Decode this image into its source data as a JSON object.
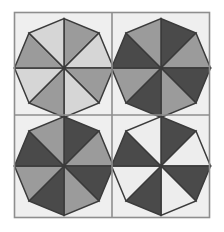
{
  "figure": {
    "type": "geometric-pattern",
    "canvas": {
      "width": 224,
      "height": 232,
      "background": "#ffffff"
    },
    "frame": {
      "x": 14.5,
      "y": 12.5,
      "width": 195,
      "height": 205,
      "stroke": "#8e8e8e",
      "stroke_width": 1.6,
      "fill": "#efefef"
    },
    "divider": {
      "stroke": "#8e8e8e",
      "stroke_width": 1.6,
      "vertical_x": 112,
      "horizontal_y": 115
    },
    "edge_stroke": "#3b3b3b",
    "edge_stroke_width": 1.5,
    "palette": {
      "very_light": "#ededed",
      "light": "#d6d6d6",
      "medium": "#9b9b9b",
      "dark": "#4a4a4a",
      "background": "#efefef",
      "frame_line": "#8e8e8e",
      "triangle_line": "#3b3b3b"
    },
    "panels": [
      {
        "name": "top-left",
        "center": [
          64,
          68
        ],
        "bounds": [
          14.5,
          12.5,
          112,
          115
        ],
        "octagon_radius_axis": 49.5,
        "octagon_radius_diag": 49.5,
        "colors": [
          "#9b9b9b",
          "#d6d6d6",
          "#9b9b9b",
          "#d6d6d6",
          "#9b9b9b",
          "#d6d6d6",
          "#9b9b9b",
          "#d6d6d6"
        ]
      },
      {
        "name": "top-right",
        "center": [
          161,
          68
        ],
        "bounds": [
          112,
          12.5,
          209.5,
          115
        ],
        "octagon_radius_axis": 49.5,
        "octagon_radius_diag": 49.5,
        "colors": [
          "#4a4a4a",
          "#9b9b9b",
          "#4a4a4a",
          "#9b9b9b",
          "#4a4a4a",
          "#9b9b9b",
          "#4a4a4a",
          "#9b9b9b"
        ]
      },
      {
        "name": "bottom-left",
        "center": [
          64,
          166
        ],
        "bounds": [
          14.5,
          115,
          112,
          217.5
        ],
        "octagon_radius_axis": 49.5,
        "octagon_radius_diag": 49.5,
        "colors": [
          "#4a4a4a",
          "#9b9b9b",
          "#4a4a4a",
          "#9b9b9b",
          "#4a4a4a",
          "#9b9b9b",
          "#4a4a4a",
          "#9b9b9b"
        ]
      },
      {
        "name": "bottom-right",
        "center": [
          161,
          166
        ],
        "bounds": [
          112,
          115,
          209.5,
          217.5
        ],
        "octagon_radius_axis": 49.5,
        "octagon_radius_diag": 49.5,
        "colors": [
          "#4a4a4a",
          "#ededed",
          "#4a4a4a",
          "#ededed",
          "#4a4a4a",
          "#ededed",
          "#4a4a4a",
          "#ededed"
        ]
      }
    ]
  }
}
